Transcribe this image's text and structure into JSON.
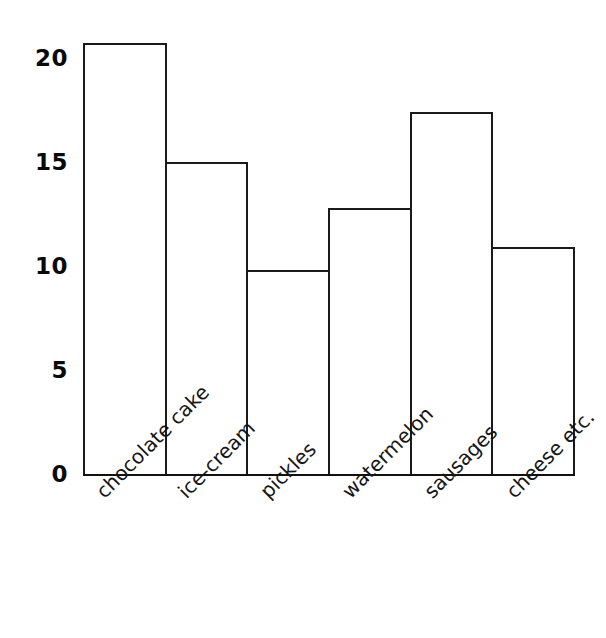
{
  "chart_data": {
    "type": "bar",
    "title": "",
    "subtitle": "",
    "xlabel": "",
    "ylabel": "",
    "categories": [
      "chocolate cake",
      "ice-cream",
      "pickles",
      "watermelon",
      "sausages",
      "cheese etc."
    ],
    "values": [
      20.7,
      15.0,
      9.8,
      12.8,
      17.4,
      10.9
    ],
    "ylim": [
      0,
      20.7
    ],
    "yticks": [
      0,
      5,
      10,
      15,
      20
    ],
    "ytick_labels": [
      "0",
      "5",
      "10",
      "15",
      "20"
    ],
    "grid": false,
    "legend": false,
    "legend_position": "none",
    "bar_fill_color": "#ffffff",
    "bar_edge_color": "#1a1a1a",
    "axis_color": "#111111",
    "background_color": "#ffffff",
    "text_color": "#0a0a0a"
  },
  "axis": {
    "y_ticks": [
      {
        "label": "20",
        "value": 20
      },
      {
        "label": "15",
        "value": 15
      },
      {
        "label": "10",
        "value": 10
      },
      {
        "label": "5",
        "value": 5
      },
      {
        "label": "0",
        "value": 0
      }
    ]
  }
}
